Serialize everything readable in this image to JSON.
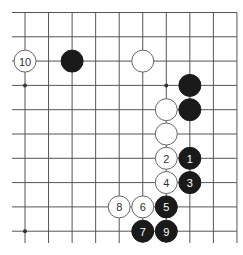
{
  "diagram": {
    "type": "go-board-fragment",
    "columns": 10,
    "rows": 10,
    "open_edges": [
      "left",
      "bottom"
    ],
    "closed_edges": [
      "top",
      "right"
    ],
    "colors": {
      "black": "#1a1a1a",
      "white": "#ffffff",
      "line": "#555555"
    },
    "star_points": [
      {
        "col": 0,
        "row": 3
      },
      {
        "col": 6,
        "row": 3
      },
      {
        "col": 0,
        "row": 9
      },
      {
        "col": 6,
        "row": 9
      }
    ],
    "stones": [
      {
        "color": "white",
        "col": 0,
        "row": 2,
        "label": "10"
      },
      {
        "color": "black",
        "col": 2,
        "row": 2,
        "label": ""
      },
      {
        "color": "white",
        "col": 5,
        "row": 2,
        "label": ""
      },
      {
        "color": "black",
        "col": 7,
        "row": 3,
        "label": ""
      },
      {
        "color": "white",
        "col": 6,
        "row": 4,
        "label": ""
      },
      {
        "color": "black",
        "col": 7,
        "row": 4,
        "label": ""
      },
      {
        "color": "white",
        "col": 6,
        "row": 5,
        "label": ""
      },
      {
        "color": "white",
        "col": 6,
        "row": 6,
        "label": "2"
      },
      {
        "color": "black",
        "col": 7,
        "row": 6,
        "label": "1"
      },
      {
        "color": "white",
        "col": 6,
        "row": 7,
        "label": "4"
      },
      {
        "color": "black",
        "col": 7,
        "row": 7,
        "label": "3"
      },
      {
        "color": "white",
        "col": 4,
        "row": 8,
        "label": "8"
      },
      {
        "color": "white",
        "col": 5,
        "row": 8,
        "label": "6"
      },
      {
        "color": "black",
        "col": 6,
        "row": 8,
        "label": "5"
      },
      {
        "color": "black",
        "col": 5,
        "row": 9,
        "label": "7"
      },
      {
        "color": "black",
        "col": 6,
        "row": 9,
        "label": "9"
      }
    ]
  }
}
